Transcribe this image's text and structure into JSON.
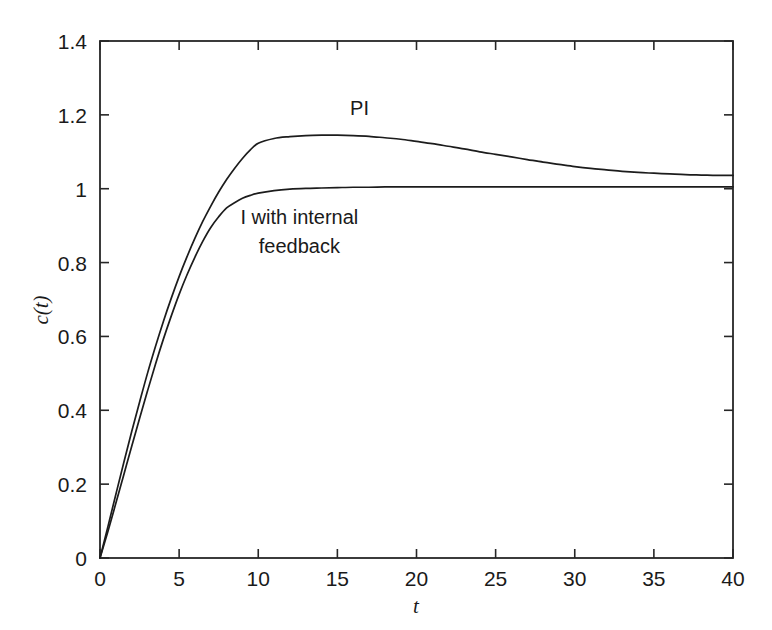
{
  "figure": {
    "background_color": "#ffffff",
    "line_color": "#1c1c1c",
    "axis_color": "#262626"
  },
  "chart_data": {
    "type": "line",
    "title": "",
    "subtitle": "",
    "xlabel": "t",
    "ylabel": "c(t)",
    "xlim": [
      0,
      40
    ],
    "ylim": [
      0,
      1.4
    ],
    "grid": false,
    "legend_position": "inline-annotation",
    "x_ticks": [
      0,
      5,
      10,
      15,
      20,
      25,
      30,
      35,
      40
    ],
    "x_tick_labels": [
      "0",
      "5",
      "10",
      "15",
      "20",
      "25",
      "30",
      "35",
      "40"
    ],
    "y_ticks": [
      0,
      0.2,
      0.4,
      0.6,
      0.8,
      1,
      1.2,
      1.4
    ],
    "y_tick_labels": [
      "0",
      "0.2",
      "0.4",
      "0.6",
      "0.8",
      "1",
      "1.2",
      "1.4"
    ],
    "annotations": [
      {
        "text": "PI",
        "x": 16.4,
        "y": 1.2
      },
      {
        "text": "I with internal",
        "x": 12.6,
        "y": 0.905
      },
      {
        "text": "feedback",
        "x": 12.6,
        "y": 0.825
      }
    ],
    "series": [
      {
        "name": "PI",
        "x": [
          0,
          0.5,
          1,
          1.5,
          2,
          2.5,
          3,
          3.5,
          4,
          4.5,
          5,
          5.5,
          6,
          6.5,
          7,
          7.5,
          8,
          8.5,
          9,
          9.5,
          10,
          11,
          12,
          13,
          14,
          15,
          16,
          17,
          18,
          19,
          20,
          21,
          22,
          23,
          24,
          25,
          26,
          27,
          28,
          29,
          30,
          31,
          32,
          33,
          34,
          35,
          36,
          37,
          38,
          39,
          40
        ],
        "values": [
          0,
          0.085,
          0.172,
          0.258,
          0.342,
          0.422,
          0.5,
          0.572,
          0.64,
          0.703,
          0.762,
          0.816,
          0.866,
          0.912,
          0.953,
          0.991,
          1.025,
          1.055,
          1.082,
          1.105,
          1.123,
          1.136,
          1.141,
          1.144,
          1.145,
          1.145,
          1.144,
          1.142,
          1.138,
          1.134,
          1.128,
          1.122,
          1.115,
          1.108,
          1.1,
          1.093,
          1.086,
          1.079,
          1.072,
          1.066,
          1.06,
          1.055,
          1.051,
          1.047,
          1.044,
          1.042,
          1.04,
          1.038,
          1.037,
          1.036,
          1.036
        ]
      },
      {
        "name": "I with internal feedback",
        "x": [
          0,
          0.5,
          1,
          1.5,
          2,
          2.5,
          3,
          3.5,
          4,
          4.5,
          5,
          5.5,
          6,
          6.5,
          7,
          7.5,
          8,
          8.5,
          9,
          9.5,
          10,
          11,
          12,
          13,
          14,
          15,
          16,
          17,
          18,
          19,
          20,
          22,
          24,
          26,
          28,
          30,
          32,
          34,
          36,
          38,
          40
        ],
        "values": [
          0,
          0.072,
          0.148,
          0.225,
          0.302,
          0.378,
          0.452,
          0.524,
          0.592,
          0.655,
          0.714,
          0.767,
          0.815,
          0.858,
          0.895,
          0.924,
          0.948,
          0.962,
          0.974,
          0.982,
          0.988,
          0.995,
          0.999,
          1.001,
          1.002,
          1.003,
          1.004,
          1.004,
          1.005,
          1.005,
          1.005,
          1.005,
          1.005,
          1.005,
          1.005,
          1.005,
          1.005,
          1.005,
          1.005,
          1.005,
          1.005
        ]
      }
    ],
    "key_points": {
      "pi_overshoot_peak_value": 1.145,
      "pi_overshoot_peak_t": 15,
      "pi_value_at_t40": 1.036,
      "crossover_t": 7.1,
      "crossover_value": 0.955,
      "i_steady_state": 1.005
    }
  }
}
